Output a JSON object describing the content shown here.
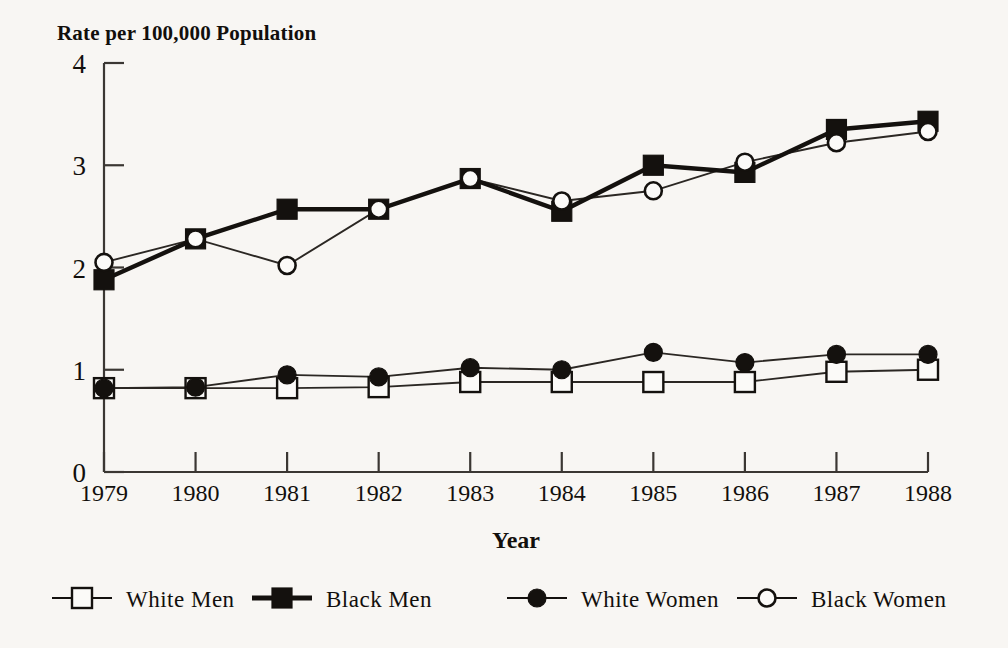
{
  "chart_data": {
    "type": "line",
    "title": "Rate per 100,000 Population",
    "xlabel": "Year",
    "ylabel": "Rate per 100,000 Population",
    "categories": [
      "1979",
      "1980",
      "1981",
      "1982",
      "1983",
      "1984",
      "1985",
      "1986",
      "1987",
      "1988"
    ],
    "x": [
      1979,
      1980,
      1981,
      1982,
      1983,
      1984,
      1985,
      1986,
      1987,
      1988
    ],
    "ylim": [
      0,
      4
    ],
    "yticks": [
      0,
      1,
      2,
      3,
      4
    ],
    "ytick_labels": [
      "0",
      "1",
      "2",
      "3",
      "4"
    ],
    "xlim": [
      1979,
      1988
    ],
    "grid": false,
    "legend_position": "bottom",
    "series": [
      {
        "name": "White Men",
        "marker": "open-square",
        "line": "thin",
        "values": [
          0.82,
          0.82,
          0.82,
          0.83,
          0.88,
          0.88,
          0.88,
          0.88,
          0.98,
          1.0
        ]
      },
      {
        "name": "Black Men",
        "marker": "filled-square",
        "line": "thick",
        "values": [
          1.88,
          2.28,
          2.57,
          2.57,
          2.87,
          2.55,
          3.0,
          2.93,
          3.35,
          3.43
        ]
      },
      {
        "name": "White Women",
        "marker": "filled-circle",
        "line": "thin",
        "values": [
          0.82,
          0.83,
          0.95,
          0.93,
          1.02,
          1.0,
          1.17,
          1.07,
          1.15,
          1.15
        ]
      },
      {
        "name": "Black Women",
        "marker": "open-circle",
        "line": "thin",
        "values": [
          2.05,
          2.28,
          2.02,
          2.57,
          2.87,
          2.65,
          2.75,
          3.03,
          3.22,
          3.33
        ]
      }
    ]
  },
  "legend": {
    "items": [
      {
        "label": "White Men",
        "marker": "open-square"
      },
      {
        "label": "Black Men",
        "marker": "filled-square"
      },
      {
        "label": "White Women",
        "marker": "filled-circle"
      },
      {
        "label": "Black Women",
        "marker": "open-circle"
      }
    ]
  },
  "colors": {
    "background": "#f8f6f3",
    "ink": "#14110e",
    "axis": "#3b3733",
    "marker_fill": "#fbfaf8"
  }
}
